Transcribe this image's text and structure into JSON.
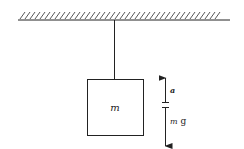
{
  "diagram": {
    "type": "physics-free-body",
    "ceiling": {
      "hatched": true
    },
    "mass": {
      "label": "m"
    },
    "arrows": [
      {
        "direction": "up",
        "label": "a"
      },
      {
        "direction": "down",
        "label_italic": "m",
        "label_roman": " g"
      }
    ],
    "colors": {
      "stroke": "#222222",
      "background": "#ffffff"
    }
  }
}
